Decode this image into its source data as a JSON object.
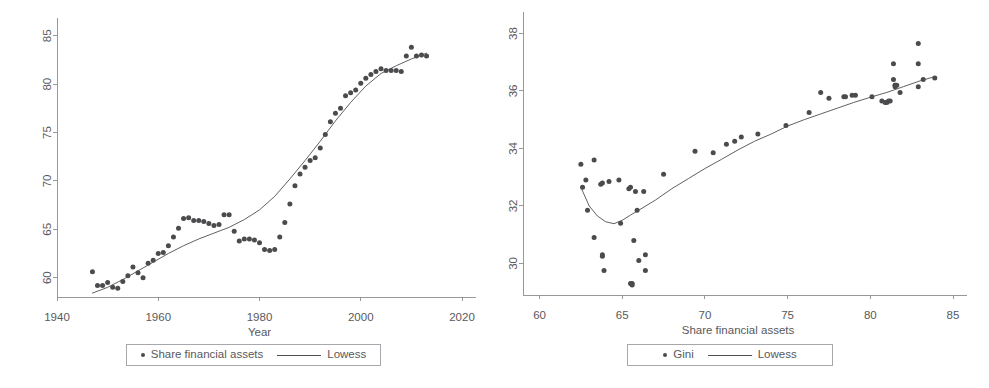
{
  "figure": {
    "panel_count": 2,
    "background_color": "#ffffff",
    "marker_color": "#4b4b4e",
    "line_color": "#4f4f52",
    "axis_color": "#8d8d90",
    "text_color": "#59595c"
  },
  "left_panel": {
    "legend": {
      "scatter_label": "Share financial assets",
      "line_label": "Lowess",
      "scatter_marker": "filled-circle-marker",
      "line_marker": "solid-line-marker"
    },
    "xlabel": "Year",
    "ylabel": "",
    "xticks": [
      "1940",
      "1960",
      "1980",
      "2000",
      "2020"
    ],
    "yticks": [
      "60",
      "65",
      "70",
      "75",
      "80",
      "85"
    ]
  },
  "right_panel": {
    "legend": {
      "scatter_label": "Gini",
      "line_label": "Lowess",
      "scatter_marker": "filled-circle-marker",
      "line_marker": "solid-line-marker"
    },
    "xlabel": "Share financial assets",
    "ylabel": "",
    "xticks": [
      "60",
      "65",
      "70",
      "75",
      "80",
      "85"
    ],
    "yticks": [
      "30",
      "32",
      "34",
      "36",
      "38"
    ]
  },
  "chart_data": [
    {
      "id": "left",
      "type": "scatter",
      "title": "",
      "xlabel": "Year",
      "ylabel": "",
      "xlim": [
        1940,
        2020
      ],
      "ylim": [
        58.0,
        85.8
      ],
      "xticks": [
        1940,
        1960,
        1980,
        2000,
        2020
      ],
      "yticks": [
        60,
        65,
        70,
        75,
        80,
        85
      ],
      "grid": false,
      "legend_position": "below-axis",
      "series": [
        {
          "name": "Share financial assets",
          "type": "scatter",
          "marker": "filled-circle",
          "color": "#4b4b4e",
          "points": [
            [
              1947,
              60.6
            ],
            [
              1948,
              59.2
            ],
            [
              1949,
              59.2
            ],
            [
              1950,
              59.5
            ],
            [
              1951,
              59.0
            ],
            [
              1952,
              58.9
            ],
            [
              1953,
              59.6
            ],
            [
              1954,
              60.2
            ],
            [
              1955,
              61.1
            ],
            [
              1956,
              60.5
            ],
            [
              1957,
              60.0
            ],
            [
              1958,
              61.5
            ],
            [
              1959,
              61.8
            ],
            [
              1960,
              62.5
            ],
            [
              1961,
              62.6
            ],
            [
              1962,
              63.3
            ],
            [
              1963,
              64.2
            ],
            [
              1964,
              65.1
            ],
            [
              1965,
              66.1
            ],
            [
              1966,
              66.2
            ],
            [
              1967,
              65.9
            ],
            [
              1968,
              65.9
            ],
            [
              1969,
              65.8
            ],
            [
              1970,
              65.6
            ],
            [
              1971,
              65.4
            ],
            [
              1972,
              65.5
            ],
            [
              1973,
              66.5
            ],
            [
              1974,
              66.5
            ],
            [
              1975,
              64.8
            ],
            [
              1976,
              63.8
            ],
            [
              1977,
              64.0
            ],
            [
              1978,
              64.0
            ],
            [
              1979,
              63.9
            ],
            [
              1980,
              63.6
            ],
            [
              1981,
              62.9
            ],
            [
              1982,
              62.8
            ],
            [
              1983,
              62.9
            ],
            [
              1984,
              64.2
            ],
            [
              1985,
              65.7
            ],
            [
              1986,
              67.6
            ],
            [
              1987,
              69.5
            ],
            [
              1988,
              70.7
            ],
            [
              1989,
              71.4
            ],
            [
              1990,
              72.1
            ],
            [
              1991,
              72.4
            ],
            [
              1992,
              73.4
            ],
            [
              1993,
              74.8
            ],
            [
              1994,
              76.1
            ],
            [
              1995,
              77.0
            ],
            [
              1996,
              77.5
            ],
            [
              1997,
              78.8
            ],
            [
              1998,
              79.1
            ],
            [
              1999,
              79.4
            ],
            [
              2000,
              80.1
            ],
            [
              2001,
              80.6
            ],
            [
              2002,
              81.0
            ],
            [
              2003,
              81.3
            ],
            [
              2004,
              81.6
            ],
            [
              2005,
              81.4
            ],
            [
              2006,
              81.4
            ],
            [
              2007,
              81.4
            ],
            [
              2008,
              81.3
            ],
            [
              2009,
              82.9
            ],
            [
              2010,
              83.8
            ],
            [
              2011,
              82.9
            ],
            [
              2012,
              83.0
            ],
            [
              2013,
              82.9
            ]
          ]
        },
        {
          "name": "Lowess",
          "type": "line",
          "color": "#4f4f52",
          "points": [
            [
              1947,
              58.4
            ],
            [
              1950,
              59.0
            ],
            [
              1953,
              59.8
            ],
            [
              1956,
              60.7
            ],
            [
              1959,
              61.6
            ],
            [
              1962,
              62.5
            ],
            [
              1965,
              63.3
            ],
            [
              1968,
              64.0
            ],
            [
              1971,
              64.6
            ],
            [
              1974,
              65.2
            ],
            [
              1977,
              66.0
            ],
            [
              1980,
              67.0
            ],
            [
              1983,
              68.4
            ],
            [
              1986,
              70.2
            ],
            [
              1989,
              72.1
            ],
            [
              1992,
              74.1
            ],
            [
              1995,
              76.2
            ],
            [
              1998,
              78.1
            ],
            [
              2001,
              79.8
            ],
            [
              2004,
              81.1
            ],
            [
              2007,
              81.9
            ],
            [
              2010,
              82.6
            ],
            [
              2013,
              83.2
            ]
          ]
        }
      ]
    },
    {
      "id": "right",
      "type": "scatter",
      "title": "",
      "xlabel": "Share financial assets",
      "ylabel": "",
      "xlim": [
        59.0,
        85.0
      ],
      "ylim": [
        28.9,
        38.4
      ],
      "xticks": [
        60,
        65,
        70,
        75,
        80,
        85
      ],
      "yticks": [
        30,
        32,
        34,
        36,
        38
      ],
      "grid": false,
      "legend_position": "below-axis",
      "series": [
        {
          "name": "Gini",
          "type": "scatter",
          "marker": "filled-circle",
          "color": "#4b4b4e",
          "points": [
            [
              62.5,
              33.45
            ],
            [
              62.6,
              32.65
            ],
            [
              62.8,
              32.9
            ],
            [
              62.9,
              31.85
            ],
            [
              63.3,
              33.6
            ],
            [
              63.3,
              30.9
            ],
            [
              63.7,
              32.75
            ],
            [
              63.8,
              32.8
            ],
            [
              63.8,
              30.3
            ],
            [
              63.8,
              30.25
            ],
            [
              63.9,
              29.75
            ],
            [
              64.2,
              32.85
            ],
            [
              64.8,
              32.9
            ],
            [
              64.9,
              31.4
            ],
            [
              65.4,
              32.6
            ],
            [
              65.5,
              32.65
            ],
            [
              65.5,
              29.3
            ],
            [
              65.6,
              29.3
            ],
            [
              65.6,
              29.25
            ],
            [
              65.7,
              30.8
            ],
            [
              65.8,
              32.5
            ],
            [
              65.9,
              31.85
            ],
            [
              66.0,
              30.1
            ],
            [
              66.3,
              32.5
            ],
            [
              66.4,
              30.3
            ],
            [
              66.4,
              29.75
            ],
            [
              67.5,
              33.1
            ],
            [
              69.4,
              33.9
            ],
            [
              70.5,
              33.85
            ],
            [
              71.3,
              34.15
            ],
            [
              71.8,
              34.25
            ],
            [
              72.2,
              34.4
            ],
            [
              73.2,
              34.5
            ],
            [
              74.9,
              34.8
            ],
            [
              76.3,
              35.25
            ],
            [
              77.0,
              35.95
            ],
            [
              77.5,
              35.75
            ],
            [
              78.4,
              35.8
            ],
            [
              78.5,
              35.8
            ],
            [
              78.9,
              35.85
            ],
            [
              79.1,
              35.85
            ],
            [
              80.1,
              35.8
            ],
            [
              80.7,
              35.65
            ],
            [
              80.9,
              35.6
            ],
            [
              81.0,
              35.6
            ],
            [
              81.1,
              35.65
            ],
            [
              81.2,
              35.65
            ],
            [
              81.4,
              36.95
            ],
            [
              81.4,
              36.4
            ],
            [
              81.5,
              36.2
            ],
            [
              81.5,
              36.2
            ],
            [
              81.5,
              36.15
            ],
            [
              81.6,
              36.2
            ],
            [
              81.8,
              35.95
            ],
            [
              82.9,
              37.65
            ],
            [
              82.9,
              36.95
            ],
            [
              82.9,
              36.15
            ],
            [
              83.2,
              36.4
            ],
            [
              83.9,
              36.45
            ]
          ]
        },
        {
          "name": "Lowess",
          "type": "line",
          "color": "#4f4f52",
          "points": [
            [
              62.5,
              32.65
            ],
            [
              63.0,
              32.0
            ],
            [
              63.5,
              31.65
            ],
            [
              64.0,
              31.45
            ],
            [
              64.5,
              31.38
            ],
            [
              65.0,
              31.5
            ],
            [
              65.5,
              31.68
            ],
            [
              66.0,
              31.85
            ],
            [
              67.0,
              32.2
            ],
            [
              68.0,
              32.6
            ],
            [
              69.0,
              32.95
            ],
            [
              70.0,
              33.3
            ],
            [
              71.0,
              33.62
            ],
            [
              72.0,
              33.95
            ],
            [
              73.0,
              34.25
            ],
            [
              74.0,
              34.5
            ],
            [
              75.0,
              34.78
            ],
            [
              76.0,
              35.0
            ],
            [
              77.0,
              35.2
            ],
            [
              78.0,
              35.4
            ],
            [
              79.0,
              35.6
            ],
            [
              80.0,
              35.78
            ],
            [
              81.0,
              35.95
            ],
            [
              82.0,
              36.15
            ],
            [
              83.0,
              36.35
            ],
            [
              83.9,
              36.5
            ]
          ]
        }
      ]
    }
  ]
}
